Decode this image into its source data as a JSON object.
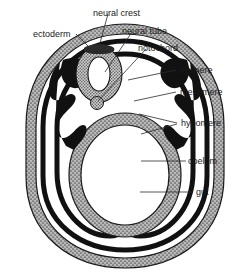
{
  "figure": {
    "background_color": "#ffffff",
    "width": 251,
    "height": 275
  },
  "colors": {
    "outline": "#1a1a1a",
    "ectoderm_fill": "#9a9a9a",
    "mesoderm_fill": "#111111",
    "neural_tube_fill": "#8f8f8f",
    "notochord_fill": "#7d7d7d",
    "gut_wall_fill": "#9a9a9a",
    "coelom_fill": "#ffffff",
    "lumen_fill": "#ffffff",
    "leader_line": "#2b2b2b",
    "label_text": "#1a1a1a"
  },
  "labels": [
    {
      "id": "ectoderm",
      "text": "ectoderm",
      "x": 33,
      "y": 30,
      "anchor_x": 78,
      "anchor_y": 48,
      "leader": [
        [
          76,
          34
        ],
        [
          89,
          47
        ]
      ]
    },
    {
      "id": "neural-crest",
      "text": "neural crest",
      "x": 93,
      "y": 9,
      "anchor_x": 96,
      "anchor_y": 53,
      "leader": [
        [
          108,
          14
        ],
        [
          97,
          54
        ]
      ]
    },
    {
      "id": "neural-tube",
      "text": "neural tube",
      "x": 122,
      "y": 27,
      "anchor_x": 104,
      "anchor_y": 70,
      "leader": [
        [
          132,
          32
        ],
        [
          105,
          72
        ]
      ]
    },
    {
      "id": "notochord",
      "text": "notochord",
      "x": 138,
      "y": 44,
      "anchor_x": 97,
      "anchor_y": 102,
      "leader": [
        [
          146,
          49
        ],
        [
          98,
          101
        ]
      ]
    },
    {
      "id": "epimere",
      "text": "epimere",
      "x": 180,
      "y": 66,
      "anchor_x": 126,
      "anchor_y": 79,
      "leader": [
        [
          176,
          70
        ],
        [
          128,
          80
        ]
      ]
    },
    {
      "id": "mesomere",
      "text": "mesomere",
      "x": 180,
      "y": 88,
      "anchor_x": 133,
      "anchor_y": 99,
      "leader": [
        [
          176,
          92
        ],
        [
          134,
          101
        ]
      ]
    },
    {
      "id": "hypomere",
      "text": "hypomere",
      "x": 181,
      "y": 119,
      "anchor_x": 140,
      "anchor_y": 115,
      "leader": [
        [
          177,
          123
        ],
        [
          139,
          114
        ]
      ],
      "leader2": [
        [
          177,
          124
        ],
        [
          141,
          134
        ]
      ]
    },
    {
      "id": "coelom",
      "text": "coelom",
      "x": 188,
      "y": 157,
      "anchor_x": 148,
      "anchor_y": 161,
      "leader": [
        [
          186,
          161
        ],
        [
          141,
          161
        ]
      ]
    },
    {
      "id": "gut",
      "text": "gut",
      "x": 196,
      "y": 188,
      "anchor_x": 150,
      "anchor_y": 192,
      "leader": [
        [
          193,
          192
        ],
        [
          140,
          192
        ]
      ]
    }
  ],
  "structures": [
    {
      "id": "ectoderm-layer",
      "name": "ectoderm",
      "description": "outer stippled gray body wall band"
    },
    {
      "id": "neural-crest-mass",
      "name": "neural crest",
      "description": "small dark mass dorsal to neural tube"
    },
    {
      "id": "neural-tube-ring",
      "name": "neural tube",
      "description": "dorsal stippled oval ring with white lumen"
    },
    {
      "id": "notochord-circle",
      "name": "notochord",
      "description": "small stippled circle ventral to neural tube"
    },
    {
      "id": "epimere-mass",
      "name": "epimere",
      "description": "dorsal black somite mesoderm"
    },
    {
      "id": "mesomere-mass",
      "name": "mesomere",
      "description": "intermediate black mesoderm stalk"
    },
    {
      "id": "hypomere-layers",
      "name": "hypomere",
      "description": "lateral plate black mesoderm splitting into somatic and splanchnic layers"
    },
    {
      "id": "coelom-space",
      "name": "coelom",
      "description": "white cavity between hypomere layers"
    },
    {
      "id": "gut-tube",
      "name": "gut",
      "description": "large central stippled oval gut wall with white lumen"
    }
  ]
}
